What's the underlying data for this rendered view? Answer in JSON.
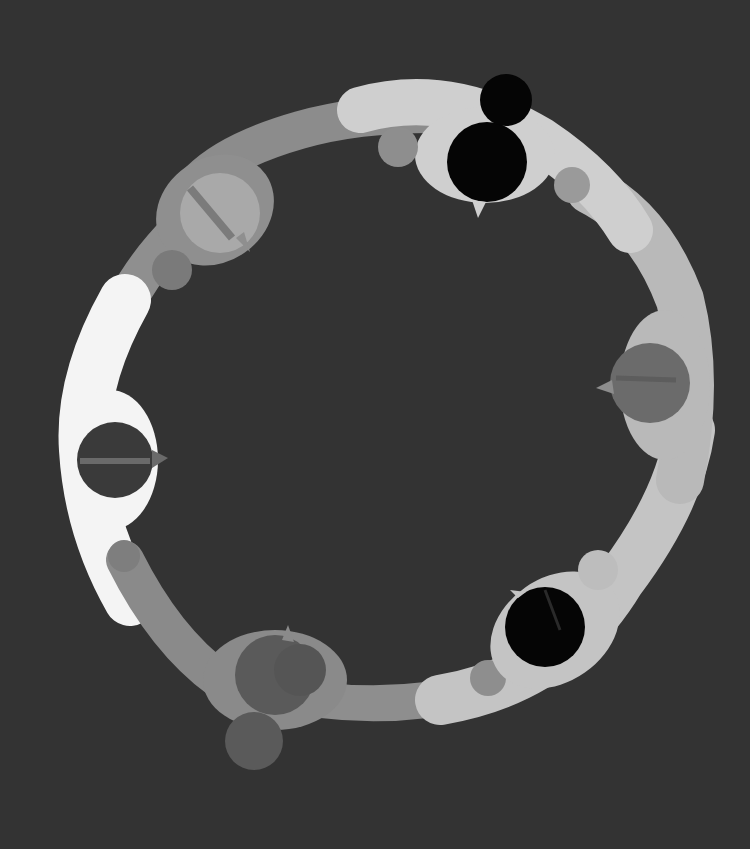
{
  "background_color": "#333333",
  "figures": [
    {
      "name": "figure-top",
      "body_color": "#cfcfcf",
      "head_color": "#050505",
      "hair_color": "#000000",
      "hand_color": "#8e8e8e",
      "extra_head": true
    },
    {
      "name": "figure-upper-left",
      "body_color": "#8f8f8f",
      "head_color": "#a9a9a9",
      "hair_color": "#7b7b7b",
      "hand_color": "#7a7a7a",
      "extra_head": false
    },
    {
      "name": "figure-left",
      "body_color": "#f4f4f4",
      "head_color": "#3a3a3a",
      "hair_color": "#6a6a6a",
      "hand_color": "#7e7e7e",
      "extra_head": false
    },
    {
      "name": "figure-bottom-left",
      "body_color": "#8a8a8a",
      "head_color": "#5a5a5a",
      "hair_color": "#555555",
      "hand_color": "#666666",
      "extra_head": true
    },
    {
      "name": "figure-bottom-right",
      "body_color": "#c4c4c4",
      "head_color": "#050505",
      "hair_color": "#1a1a1a",
      "hand_color": "#bdbdbd",
      "extra_head": false
    },
    {
      "name": "figure-right",
      "body_color": "#b9b9b9",
      "head_color": "#6b6b6b",
      "hair_color": "#5d5d5d",
      "hand_color": "#999999",
      "extra_head": false
    }
  ]
}
